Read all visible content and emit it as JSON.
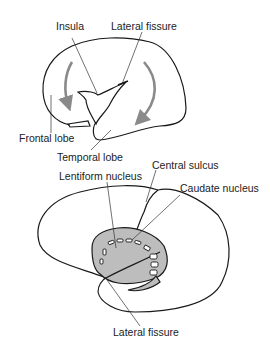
{
  "figure": {
    "top_panel": {
      "labels": {
        "insula": "Insula",
        "lateral_fissure": "Lateral fissure",
        "frontal_lobe": "Frontal lobe",
        "temporal_lobe": "Temporal lobe"
      }
    },
    "bottom_panel": {
      "labels": {
        "central_sulcus": "Central sulcus",
        "lentiform_nucleus": "Lentiform nucleus",
        "caudate_nucleus": "Caudate nucleus",
        "lateral_fissure": "Lateral fissure"
      }
    },
    "colors": {
      "outline": "#1a1a1a",
      "arrow": "#8a8a8a",
      "nucleus_fill": "#bdbdbd",
      "background": "#ffffff"
    }
  }
}
